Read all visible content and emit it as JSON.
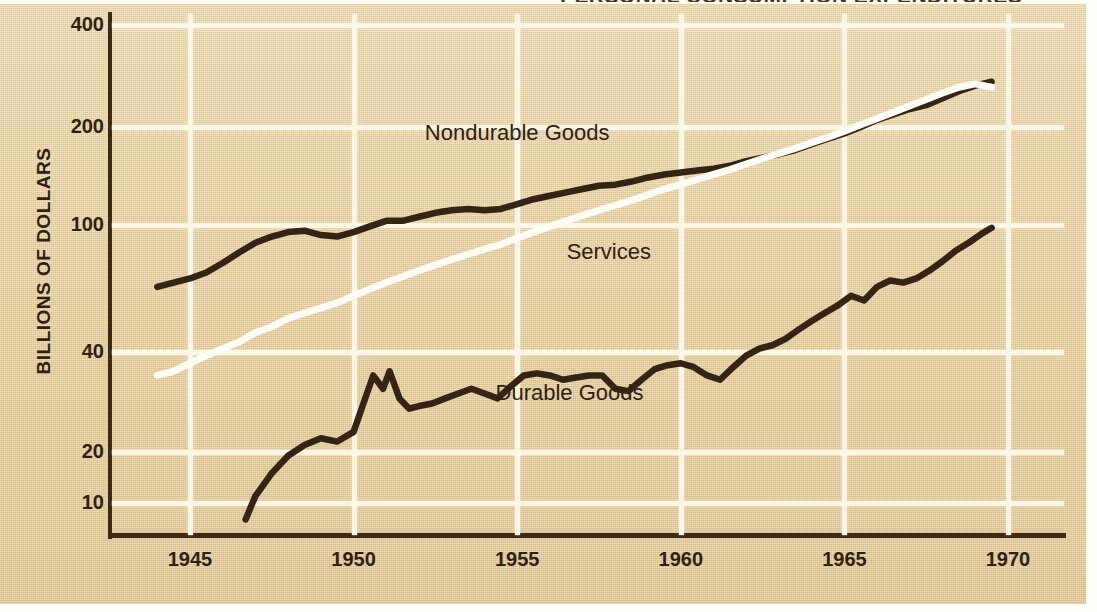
{
  "chart_data": {
    "type": "line",
    "title": "PERSONAL CONSUMPTION EXPENDITURES",
    "xlabel": "",
    "ylabel": "BILLIONS OF DOLLARS",
    "yscale": "log",
    "ylim": [
      7,
      460
    ],
    "xlim": [
      1943.8,
      1970.5
    ],
    "grid": true,
    "legend": "inline-annotations",
    "yticks": [
      10,
      20,
      40,
      100,
      200,
      400
    ],
    "ytick_labels": [
      "10",
      "20",
      "40",
      "100",
      "200",
      "400"
    ],
    "xticks": [
      1945,
      1950,
      1955,
      1960,
      1965,
      1970
    ],
    "xtick_labels": [
      "1945",
      "1950",
      "1955",
      "1960",
      "1965",
      "1970"
    ],
    "annotations": [
      {
        "text": "Nondurable Goods",
        "x": 1955.0,
        "y": 190
      },
      {
        "text": "Services",
        "x": 1957.8,
        "y": 82
      },
      {
        "text": "Durable Goods",
        "x": 1956.6,
        "y": 30
      }
    ],
    "series": [
      {
        "name": "Nondurable Goods",
        "color": "#332414",
        "x": [
          1944.0,
          1944.5,
          1945.0,
          1945.5,
          1946.0,
          1946.5,
          1947.0,
          1947.5,
          1948.0,
          1948.5,
          1949.0,
          1949.5,
          1950.0,
          1950.5,
          1951.0,
          1951.5,
          1952.0,
          1952.5,
          1953.0,
          1953.5,
          1954.0,
          1954.5,
          1955.0,
          1955.5,
          1956.0,
          1956.5,
          1957.0,
          1957.5,
          1958.0,
          1958.5,
          1959.0,
          1959.5,
          1960.0,
          1960.5,
          1961.0,
          1961.5,
          1962.0,
          1962.5,
          1963.0,
          1963.5,
          1964.0,
          1964.5,
          1965.0,
          1965.5,
          1966.0,
          1966.5,
          1967.0,
          1967.5,
          1968.0,
          1968.5,
          1969.0,
          1969.5
        ],
        "y": [
          64,
          66,
          68,
          71,
          76,
          82,
          88,
          92,
          95,
          96,
          93,
          92,
          95,
          99,
          103,
          103,
          106,
          109,
          111,
          112,
          111,
          112,
          116,
          120,
          123,
          126,
          129,
          132,
          133,
          136,
          140,
          143,
          145,
          147,
          149,
          152,
          157,
          161,
          165,
          170,
          177,
          184,
          191,
          200,
          210,
          218,
          226,
          232,
          243,
          255,
          265,
          272
        ]
      },
      {
        "name": "Services",
        "color": "#fffdf6",
        "x": [
          1944.0,
          1944.5,
          1945.0,
          1945.5,
          1946.0,
          1946.5,
          1947.0,
          1947.5,
          1948.0,
          1948.5,
          1949.0,
          1949.5,
          1950.0,
          1950.5,
          1951.0,
          1951.5,
          1952.0,
          1952.5,
          1953.0,
          1953.5,
          1954.0,
          1954.5,
          1955.0,
          1955.5,
          1956.0,
          1956.5,
          1957.0,
          1957.5,
          1958.0,
          1958.5,
          1959.0,
          1959.5,
          1960.0,
          1960.5,
          1961.0,
          1961.5,
          1962.0,
          1962.5,
          1963.0,
          1963.5,
          1964.0,
          1964.5,
          1965.0,
          1965.5,
          1966.0,
          1966.5,
          1967.0,
          1967.5,
          1968.0,
          1968.5,
          1969.0,
          1969.5
        ],
        "y": [
          34,
          35,
          37,
          39,
          41,
          43,
          46,
          48,
          51,
          53,
          55,
          57,
          60,
          63,
          66,
          69,
          72,
          75,
          78,
          81,
          84,
          87,
          91,
          95,
          99,
          103,
          107,
          111,
          115,
          119,
          124,
          129,
          133,
          138,
          143,
          148,
          154,
          160,
          166,
          172,
          179,
          186,
          194,
          203,
          212,
          221,
          231,
          241,
          252,
          262,
          268,
          262
        ]
      },
      {
        "name": "Durable Goods",
        "color": "#332414",
        "x": [
          1946.7,
          1947.0,
          1947.5,
          1948.0,
          1948.5,
          1949.0,
          1949.5,
          1950.0,
          1950.3,
          1950.6,
          1950.9,
          1951.1,
          1951.4,
          1951.7,
          1952.0,
          1952.4,
          1952.8,
          1953.2,
          1953.6,
          1954.0,
          1954.4,
          1954.8,
          1955.2,
          1955.6,
          1956.0,
          1956.4,
          1956.8,
          1957.2,
          1957.6,
          1958.0,
          1958.4,
          1958.8,
          1959.2,
          1959.6,
          1960.0,
          1960.4,
          1960.8,
          1961.2,
          1961.6,
          1962.0,
          1962.4,
          1962.8,
          1963.2,
          1963.6,
          1964.0,
          1964.4,
          1964.8,
          1965.2,
          1965.6,
          1966.0,
          1966.4,
          1966.8,
          1967.2,
          1967.6,
          1968.0,
          1968.4,
          1968.8,
          1969.2,
          1969.5
        ],
        "y": [
          8,
          11,
          15,
          19,
          21,
          22,
          21.5,
          23,
          28,
          34,
          31,
          35,
          29,
          27,
          27.5,
          28,
          29,
          30,
          31,
          30,
          29,
          31.5,
          34,
          34.5,
          34,
          33,
          33.5,
          34,
          34,
          31,
          30.5,
          33,
          35.5,
          36.5,
          37,
          36,
          34,
          33,
          36,
          39,
          41,
          42,
          44,
          47,
          50,
          53,
          56,
          60,
          58,
          64,
          67,
          66,
          68,
          72,
          77,
          83,
          88,
          94,
          98
        ]
      }
    ]
  }
}
